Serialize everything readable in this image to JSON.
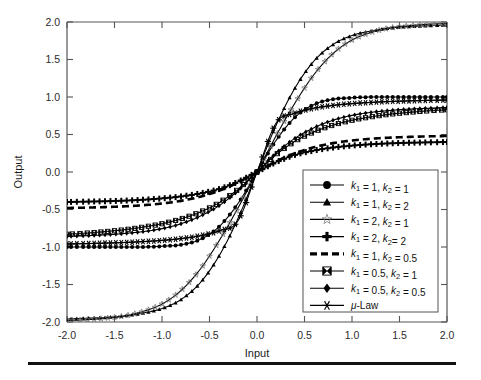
{
  "figure": {
    "background": "#ffffff",
    "axis_color": "#555555",
    "curve_color": "#000000",
    "open_marker_color": "#777777",
    "bottom_rule": true
  },
  "axes": {
    "xlabel": "Input",
    "ylabel": "Output",
    "xticks": [
      "-2.0",
      "-1.5",
      "-1.0",
      "-0.5",
      "0.0",
      "0.5",
      "1.0",
      "1.5",
      "2.0"
    ],
    "yticks": [
      "2.0",
      "1.5",
      "1.0",
      "0.5",
      "0.0",
      "-0.5",
      "-1.0",
      "-1.5",
      "-2.0"
    ],
    "xlim": [
      -2.0,
      2.0
    ],
    "ylim": [
      -2.0,
      2.0
    ]
  },
  "legend": {
    "position": "lower-right",
    "entries": [
      {
        "label": "k₁ = 1, k₂ = 1",
        "marker": "filled-circle",
        "line": "solid",
        "key": "k1_1_k2_1"
      },
      {
        "label": "k₁ = 1, k₂ = 2",
        "marker": "filled-triangle",
        "line": "solid",
        "key": "k1_1_k2_2"
      },
      {
        "label": "k₁ = 2, k₂ = 1",
        "marker": "open-star",
        "line": "solid",
        "key": "k1_2_k2_1"
      },
      {
        "label": "k₁ = 2, k₂= 2",
        "marker": "plus",
        "line": "solid",
        "key": "k1_2_k2_2"
      },
      {
        "label": "k₁ = 1, k₂ = 0.5",
        "marker": "none",
        "line": "dashed",
        "key": "k1_1_k2_05"
      },
      {
        "label": "k₁ = 0.5, k₂ = 1",
        "marker": "bowtie-square",
        "line": "solid",
        "key": "k1_05_k2_1"
      },
      {
        "label": "k₁ = 0.5, k₂ = 0.5",
        "marker": "filled-diamond",
        "line": "solid",
        "key": "k1_05_k2_05"
      },
      {
        "label": "μ-Law",
        "marker": "asterisk",
        "line": "solid",
        "key": "mu_law"
      }
    ]
  },
  "chart_data": {
    "type": "line",
    "title": "",
    "subtitle": "",
    "xlabel": "Input",
    "ylabel": "Output",
    "xlim": [
      -2.0,
      2.0
    ],
    "ylim": [
      -2.0,
      2.0
    ],
    "xticks": [
      -2.0,
      -1.5,
      -1.0,
      -0.5,
      0.0,
      0.5,
      1.0,
      1.5,
      2.0
    ],
    "yticks": [
      -2.0,
      -1.5,
      -1.0,
      -0.5,
      0.0,
      0.5,
      1.0,
      1.5,
      2.0
    ],
    "grid": false,
    "legend_position": "lower right",
    "x": [
      -2.0,
      -1.8,
      -1.6,
      -1.4,
      -1.2,
      -1.0,
      -0.8,
      -0.6,
      -0.4,
      -0.2,
      0.0,
      0.2,
      0.4,
      0.6,
      0.8,
      1.0,
      1.2,
      1.4,
      1.6,
      1.8,
      2.0
    ],
    "series": [
      {
        "name": "k₁ = 1, k₂ = 1",
        "marker": "filled-circle",
        "line": "solid",
        "saturation": [
          -1.0,
          1.0
        ],
        "values": [
          -1.0,
          -1.0,
          -1.0,
          -1.0,
          -1.0,
          -0.99,
          -0.97,
          -0.9,
          -0.73,
          -0.42,
          0.0,
          0.42,
          0.73,
          0.9,
          0.97,
          0.99,
          1.0,
          1.0,
          1.0,
          1.0,
          1.0
        ]
      },
      {
        "name": "k₁ = 1, k₂ = 2",
        "marker": "filled-triangle",
        "line": "solid",
        "saturation": [
          -2.0,
          2.0
        ],
        "values": [
          -1.96,
          -1.95,
          -1.94,
          -1.92,
          -1.88,
          -1.82,
          -1.7,
          -1.48,
          -1.12,
          -0.62,
          0.0,
          0.62,
          1.12,
          1.48,
          1.7,
          1.82,
          1.88,
          1.92,
          1.94,
          1.95,
          1.96
        ]
      },
      {
        "name": "k₁ = 2, k₂ = 1",
        "marker": "open-star",
        "line": "solid",
        "saturation": [
          -2.0,
          2.0
        ],
        "values": [
          -1.98,
          -1.97,
          -1.95,
          -1.92,
          -1.86,
          -1.76,
          -1.58,
          -1.3,
          -0.92,
          -0.48,
          0.0,
          0.48,
          0.92,
          1.3,
          1.58,
          1.76,
          1.86,
          1.92,
          1.95,
          1.97,
          1.98
        ]
      },
      {
        "name": "k₁ = 2, k₂= 2",
        "marker": "plus",
        "line": "solid",
        "saturation": [
          -0.4,
          0.4
        ],
        "values": [
          -0.4,
          -0.395,
          -0.39,
          -0.382,
          -0.37,
          -0.352,
          -0.326,
          -0.286,
          -0.228,
          -0.13,
          0.0,
          0.13,
          0.228,
          0.286,
          0.326,
          0.352,
          0.37,
          0.382,
          0.39,
          0.395,
          0.4
        ]
      },
      {
        "name": "k₁ = 1, k₂ = 0.5",
        "marker": "none",
        "line": "dashed",
        "saturation": [
          -0.48,
          0.48
        ],
        "values": [
          -0.48,
          -0.475,
          -0.468,
          -0.458,
          -0.443,
          -0.42,
          -0.385,
          -0.33,
          -0.25,
          -0.14,
          0.0,
          0.14,
          0.25,
          0.33,
          0.385,
          0.42,
          0.443,
          0.458,
          0.468,
          0.475,
          0.48
        ]
      },
      {
        "name": "k₁ = 0.5, k₂ = 1",
        "marker": "bowtie-square",
        "line": "solid",
        "saturation": [
          -0.85,
          0.85
        ],
        "values": [
          -0.83,
          -0.815,
          -0.795,
          -0.77,
          -0.735,
          -0.69,
          -0.625,
          -0.535,
          -0.41,
          -0.23,
          0.0,
          0.23,
          0.41,
          0.535,
          0.625,
          0.69,
          0.735,
          0.77,
          0.795,
          0.815,
          0.83
        ]
      },
      {
        "name": "k₁ = 0.5, k₂ = 0.5",
        "marker": "filled-diamond",
        "line": "solid",
        "saturation": [
          -0.85,
          0.85
        ],
        "values": [
          -0.86,
          -0.85,
          -0.838,
          -0.82,
          -0.795,
          -0.755,
          -0.69,
          -0.59,
          -0.45,
          -0.25,
          0.0,
          0.25,
          0.45,
          0.59,
          0.69,
          0.755,
          0.795,
          0.82,
          0.838,
          0.85,
          0.86
        ]
      },
      {
        "name": "μ-Law",
        "marker": "asterisk",
        "line": "solid",
        "saturation": [
          -1.0,
          1.0
        ],
        "values": [
          -0.96,
          -0.955,
          -0.948,
          -0.94,
          -0.928,
          -0.912,
          -0.888,
          -0.85,
          -0.785,
          -0.65,
          0.0,
          0.65,
          0.785,
          0.85,
          0.888,
          0.912,
          0.928,
          0.94,
          0.948,
          0.955,
          0.96
        ]
      }
    ]
  }
}
